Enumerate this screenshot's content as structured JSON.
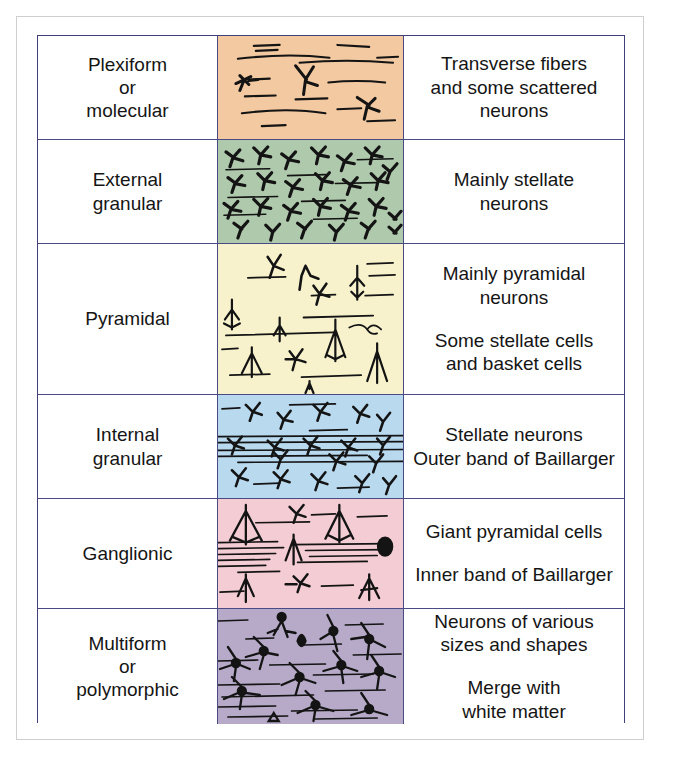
{
  "figure": {
    "border_color": "#4a4a85",
    "frame_color": "#cfcfcf"
  },
  "rows": [
    {
      "layer_name": "Plexiform\nor\nmolecular",
      "layer_name_lines": [
        "Plexiform",
        "or",
        "molecular"
      ],
      "band_color": "#f2c9a0",
      "description_blocks": [
        [
          "Transverse fibers",
          "and some scattered",
          "neurons"
        ]
      ]
    },
    {
      "layer_name_lines": [
        "External",
        "granular"
      ],
      "band_color": "#afc9ac",
      "description_blocks": [
        [
          "Mainly stellate",
          "neurons"
        ]
      ]
    },
    {
      "layer_name_lines": [
        "Pyramidal"
      ],
      "band_color": "#f7f2cc",
      "description_blocks": [
        [
          "Mainly pyramidal",
          "neurons"
        ],
        [
          "Some stellate cells",
          "and basket cells"
        ]
      ]
    },
    {
      "layer_name_lines": [
        "Internal",
        "granular"
      ],
      "band_color": "#b9d9ef",
      "description_blocks": [
        [
          "Stellate neurons",
          "Outer band of Baillarger"
        ]
      ]
    },
    {
      "layer_name_lines": [
        "Ganglionic"
      ],
      "band_color": "#f4cdd4",
      "description_blocks": [
        [
          "Giant pyramidal cells"
        ],
        [
          "Inner band of Baillarger"
        ]
      ]
    },
    {
      "layer_name_lines": [
        "Multiform",
        "or",
        "polymorphic"
      ],
      "band_color": "#b6aac8",
      "description_blocks": [
        [
          "Neurons of various",
          "sizes and shapes"
        ],
        [
          "Merge with",
          "white matter"
        ]
      ]
    }
  ]
}
